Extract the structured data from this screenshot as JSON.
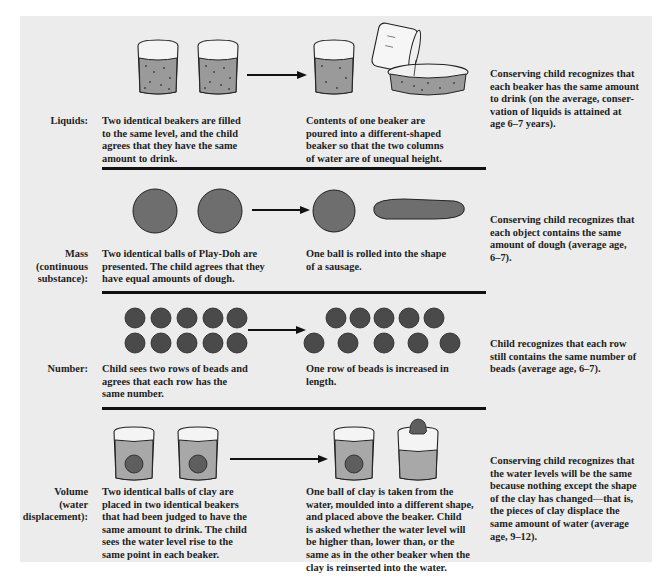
{
  "figure": {
    "rows": [
      {
        "id": "liquids",
        "label": [
          "Liquids:"
        ],
        "before": [
          "Two identical beakers are filled",
          "to the same level, and the child",
          "agrees that they have the same",
          "amount to drink."
        ],
        "after": [
          "Contents of one beaker are",
          "poured into a different-shaped",
          "beaker so that the two columns",
          "of water are of unequal height."
        ],
        "result": [
          "Conserving child recognizes that",
          "each beaker has the same amount",
          "to drink (on the average, conser-",
          "vation of liquids is attained at",
          "age 6–7 years)."
        ]
      },
      {
        "id": "mass",
        "label": [
          "Mass",
          "(continuous",
          "substance):"
        ],
        "before": [
          "Two identical balls of Play-Doh are",
          "presented. The child agrees that they",
          "have equal amounts of dough."
        ],
        "after": [
          "One ball is rolled into the shape",
          "of a sausage."
        ],
        "result": [
          "Conserving child recognizes that",
          "each object contains the same",
          "amount of dough (average age,",
          "6–7)."
        ]
      },
      {
        "id": "number",
        "label": [
          "Number:"
        ],
        "before": [
          "Child sees two rows of beads and",
          "agrees that each row has the",
          "same number."
        ],
        "after": [
          "One row of beads is increased in",
          "length."
        ],
        "result": [
          "Child recognizes that each row",
          "still contains the same number of",
          "beads (average age, 6–7)."
        ]
      },
      {
        "id": "volume",
        "label": [
          "Volume",
          "(water",
          "displacement):"
        ],
        "before": [
          "Two identical balls of clay are",
          "placed in two identical beakers",
          "that had been judged to have the",
          "same amount to drink. The child",
          "sees the water level rise to the",
          "same point in each beaker."
        ],
        "after": [
          "One ball of clay is taken from the",
          "water, moulded into a different shape,",
          "and placed above the beaker. Child",
          "is asked whether the water level will",
          "be higher than, lower than, or the",
          "same as in the other beaker when the",
          "clay is reinserted into the water."
        ],
        "result": [
          "Conserving child recognizes that",
          "the water levels will be the same",
          "because nothing except the shape",
          "of the clay has changed—that is,",
          "the pieces of clay displace the",
          "same amount of water (average",
          "age, 9–12)."
        ]
      }
    ]
  },
  "colors": {
    "panel": "#ececec",
    "ink": "#1e1e1e",
    "liquid": "#9a9a9a",
    "dough": "#6e6e6e",
    "bead": "#4a4a4a"
  }
}
